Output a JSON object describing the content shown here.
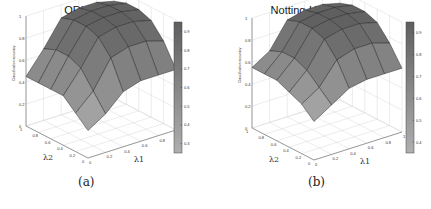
{
  "figure": {
    "panels": [
      {
        "id": "a",
        "title": "ORL",
        "caption": "(a)"
      },
      {
        "id": "b",
        "title": "Notting-Hill",
        "caption": "(b)"
      }
    ]
  },
  "chart_data": [
    {
      "type": "surface3d",
      "title": "ORL",
      "caption": "(a)",
      "xlabel": "λ1",
      "ylabel": "λ2",
      "zlabel": "Classification accuracy",
      "x_ticks": [
        0,
        0.2,
        0.4,
        0.6,
        0.8,
        1
      ],
      "y_ticks": [
        0,
        0.2,
        0.4,
        0.6,
        0.8,
        1
      ],
      "z_ticks": [
        0,
        0.2,
        0.4,
        0.6,
        0.8,
        1
      ],
      "zlim": [
        0,
        1
      ],
      "colorbar": {
        "ticks": [
          0.3,
          0.4,
          0.5,
          0.6,
          0.7,
          0.8,
          0.9
        ],
        "colormap": "gray",
        "range": [
          0.25,
          0.95
        ]
      },
      "grid": true,
      "x": [
        0,
        0.2,
        0.4,
        0.6,
        0.8,
        1
      ],
      "y": [
        0,
        0.2,
        0.4,
        0.6,
        0.8,
        1
      ],
      "z": [
        [
          0.25,
          0.35,
          0.5,
          0.55,
          0.55,
          0.55
        ],
        [
          0.35,
          0.5,
          0.75,
          0.8,
          0.8,
          0.75
        ],
        [
          0.45,
          0.65,
          0.88,
          0.92,
          0.92,
          0.88
        ],
        [
          0.45,
          0.7,
          0.92,
          0.95,
          0.95,
          0.92
        ],
        [
          0.45,
          0.7,
          0.92,
          0.95,
          0.95,
          0.92
        ],
        [
          0.45,
          0.65,
          0.88,
          0.92,
          0.92,
          0.88
        ]
      ]
    },
    {
      "type": "surface3d",
      "title": "Notting-Hill",
      "caption": "(b)",
      "xlabel": "λ1",
      "ylabel": "λ2",
      "zlabel": "Classification accuracy",
      "x_ticks": [
        0,
        0.2,
        0.4,
        0.6,
        0.8,
        1
      ],
      "y_ticks": [
        0,
        0.2,
        0.4,
        0.6,
        0.8,
        1
      ],
      "z_ticks": [
        0,
        0.2,
        0.4,
        0.6,
        0.8,
        1
      ],
      "zlim": [
        0,
        1
      ],
      "colorbar": {
        "ticks": [
          0.4,
          0.5,
          0.6,
          0.7,
          0.8,
          0.9
        ],
        "colormap": "gray",
        "range": [
          0.35,
          0.95
        ]
      },
      "grid": true,
      "x": [
        0,
        0.2,
        0.4,
        0.6,
        0.8,
        1
      ],
      "y": [
        0,
        0.2,
        0.4,
        0.6,
        0.8,
        1
      ],
      "z": [
        [
          0.35,
          0.45,
          0.55,
          0.58,
          0.58,
          0.58
        ],
        [
          0.45,
          0.55,
          0.75,
          0.8,
          0.8,
          0.75
        ],
        [
          0.5,
          0.65,
          0.88,
          0.92,
          0.92,
          0.88
        ],
        [
          0.55,
          0.7,
          0.92,
          0.95,
          0.95,
          0.92
        ],
        [
          0.55,
          0.7,
          0.92,
          0.95,
          0.95,
          0.92
        ],
        [
          0.55,
          0.65,
          0.88,
          0.92,
          0.92,
          0.88
        ]
      ]
    }
  ]
}
